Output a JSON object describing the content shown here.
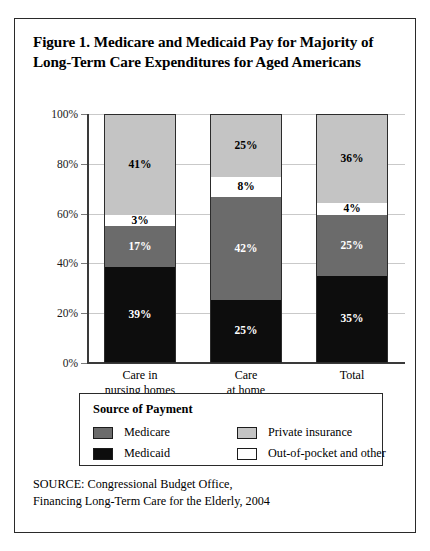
{
  "figure": {
    "title_lines": [
      "Figure 1. Medicare and Medicaid Pay for Majority of",
      "Long-Term Care Expenditures for Aged Americans"
    ],
    "source_lines": [
      "SOURCE: Congressional Budget Office,",
      "Financing Long-Term Care for the Elderly, 2004"
    ]
  },
  "legend": {
    "title": "Source of Payment",
    "items": [
      {
        "label": "Medicare",
        "color": "#6b6b6b"
      },
      {
        "label": "Private insurance",
        "color": "#c4c4c4"
      },
      {
        "label": "Medicaid",
        "color": "#0d0d0d"
      },
      {
        "label": "Out-of-pocket and other",
        "color": "#ffffff"
      }
    ]
  },
  "chart_data": {
    "type": "bar",
    "subtype": "stacked-100-percent",
    "title": "Figure 1. Medicare and Medicaid Pay for Majority of Long-Term Care Expenditures for Aged Americans",
    "xlabel": "",
    "ylabel": "",
    "ylim": [
      0,
      100
    ],
    "yticks": [
      0,
      20,
      40,
      60,
      80,
      100
    ],
    "ytick_labels": [
      "0%",
      "20%",
      "40%",
      "60%",
      "80%",
      "100%"
    ],
    "grid": true,
    "legend_position": "below-plot",
    "categories": [
      "Care in nursing homes",
      "Care at home",
      "Total"
    ],
    "category_label_lines": [
      [
        "Care in",
        "nursing homes"
      ],
      [
        "Care",
        "at home"
      ],
      [
        "Total"
      ]
    ],
    "series": [
      {
        "name": "Medicaid",
        "color": "#0d0d0d",
        "text_color": "#ffffff",
        "values": [
          39,
          25,
          35
        ],
        "labels": [
          "39%",
          "25%",
          "35%"
        ]
      },
      {
        "name": "Medicare",
        "color": "#6b6b6b",
        "text_color": "#ffffff",
        "values": [
          17,
          42,
          25
        ],
        "labels": [
          "17%",
          "42%",
          "25%"
        ]
      },
      {
        "name": "Out-of-pocket and other",
        "color": "#ffffff",
        "text_color": "#000000",
        "values": [
          3,
          8,
          4
        ],
        "labels": [
          "3%",
          "8%",
          "4%"
        ]
      },
      {
        "name": "Private insurance",
        "color": "#c4c4c4",
        "text_color": "#000000",
        "values": [
          41,
          25,
          36
        ],
        "labels": [
          "41%",
          "25%",
          "36%"
        ]
      }
    ],
    "annotations": [
      "SOURCE: Congressional Budget Office,",
      "Financing Long-Term Care for the Elderly, 2004"
    ]
  }
}
